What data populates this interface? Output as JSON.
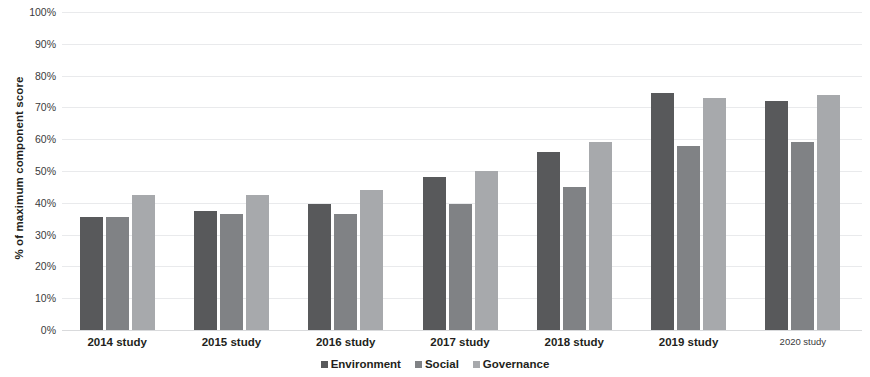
{
  "chart_data": {
    "type": "bar",
    "title": "",
    "subtitle": "",
    "xlabel": "",
    "ylabel": "% of maximum component score",
    "ylim": [
      0,
      100
    ],
    "y_unit": "%",
    "grid": true,
    "legend_position": "bottom-center",
    "categories": [
      "2014 study",
      "2015 study",
      "2016 study",
      "2017 study",
      "2018 study",
      "2019 study",
      "2020 study"
    ],
    "y_ticks": [
      "0%",
      "10%",
      "20%",
      "30%",
      "40%",
      "50%",
      "60%",
      "70%",
      "80%",
      "90%",
      "100%"
    ],
    "y_tick_values": [
      0,
      10,
      20,
      30,
      40,
      50,
      60,
      70,
      80,
      90,
      100
    ],
    "series": [
      {
        "name": "Environment",
        "color": "#58595b",
        "values": [
          35.5,
          37.5,
          39.5,
          48.0,
          56.0,
          74.5,
          72.0
        ]
      },
      {
        "name": "Social",
        "color": "#808285",
        "values": [
          35.5,
          36.5,
          36.5,
          39.5,
          45.0,
          58.0,
          59.0
        ]
      },
      {
        "name": "Governance",
        "color": "#a7a9ac",
        "values": [
          42.5,
          42.5,
          44.0,
          50.0,
          59.0,
          73.0,
          74.0
        ]
      }
    ]
  },
  "colors": {
    "background": "#ffffff",
    "gridline": "#e9eaec",
    "baseline": "#d9dadc",
    "text": "#231f20",
    "environment": "#58595b",
    "social": "#808285",
    "governance": "#a7a9ac"
  }
}
